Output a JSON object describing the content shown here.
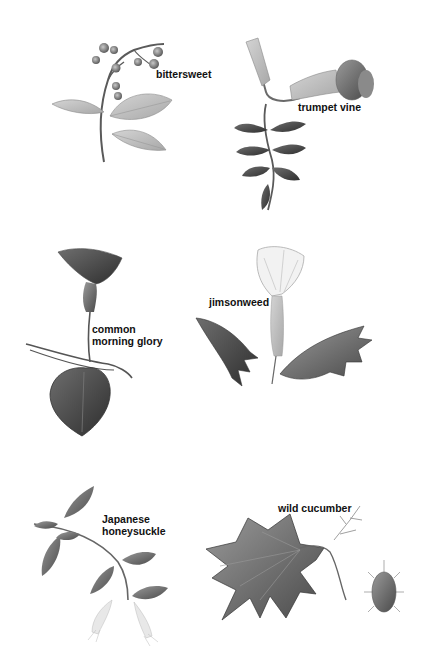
{
  "plate": {
    "background": "#ffffff",
    "ink_color": "#111111",
    "plants": [
      {
        "id": "bittersweet",
        "label": "bittersweet",
        "position": "top-left"
      },
      {
        "id": "trumpet-vine",
        "label": "trumpet vine",
        "position": "top-right"
      },
      {
        "id": "common-morning-glory",
        "label": "common\nmorning glory",
        "position": "middle-left"
      },
      {
        "id": "jimsonweed",
        "label": "jimsonweed",
        "position": "middle-right"
      },
      {
        "id": "japanese-honeysuckle",
        "label": "Japanese\nhoneysuckle",
        "position": "bottom-left"
      },
      {
        "id": "wild-cucumber",
        "label": "wild cucumber",
        "position": "bottom-right"
      }
    ]
  }
}
